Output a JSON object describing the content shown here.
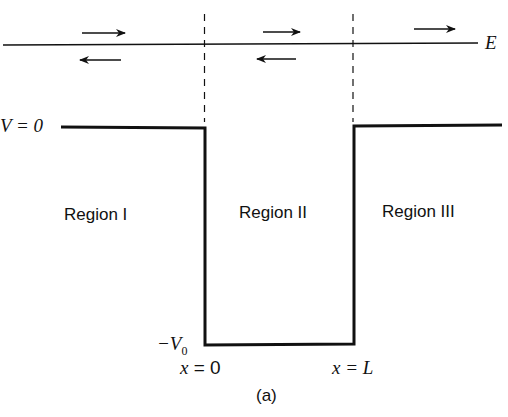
{
  "diagram": {
    "type": "finite-square-well-potential",
    "energy_label": "E",
    "v_zero_label": "V = 0",
    "v_bottom_label": "−V₀",
    "v_bottom_main": "−V",
    "v_bottom_sub": "0",
    "x_left_label": "x = 0",
    "x_left_var": "x",
    "x_left_val": "= 0",
    "x_right_var": "x",
    "x_right_val": "= L",
    "regions": [
      {
        "label": "Region I"
      },
      {
        "label": "Region II"
      },
      {
        "label": "Region III"
      }
    ],
    "caption": "(a)",
    "arrows": [
      {
        "region": "I",
        "direction": "right",
        "position": "above"
      },
      {
        "region": "I",
        "direction": "left",
        "position": "below"
      },
      {
        "region": "II",
        "direction": "right",
        "position": "above"
      },
      {
        "region": "II",
        "direction": "left",
        "position": "below"
      },
      {
        "region": "III",
        "direction": "right",
        "position": "above"
      }
    ],
    "colors": {
      "line": "#111111",
      "background": "#ffffff"
    }
  }
}
